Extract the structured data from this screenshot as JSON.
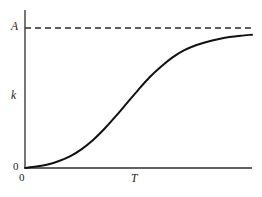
{
  "figure": {
    "background_color": "#ffffff",
    "width": 262,
    "height": 197
  },
  "labels": {
    "asymptote": "A",
    "yaxis": "k",
    "origin_y": "0",
    "origin_x": "0",
    "xaxis": "T"
  },
  "chart_data": {
    "type": "line",
    "title": "",
    "subtitle": "",
    "xlabel": "T",
    "ylabel": "k",
    "grid": false,
    "legend": null,
    "xlim": [
      0,
      1
    ],
    "ylim": [
      0,
      1.0
    ],
    "axis_ticks": {
      "x": [
        "0"
      ],
      "y": [
        "0",
        "A"
      ]
    },
    "annotations": [
      {
        "name": "asymptote-label",
        "text": "A",
        "x": 0,
        "y": 1.0,
        "position": "left-of-axis"
      },
      {
        "name": "yaxis-title",
        "text": "k",
        "x": 0,
        "y": 0.5,
        "position": "left-of-axis"
      },
      {
        "name": "origin-y-zero",
        "text": "0",
        "x": 0,
        "y": 0,
        "position": "left-of-axis"
      },
      {
        "name": "origin-x-zero",
        "text": "0",
        "x": 0,
        "y": 0,
        "position": "below-axis"
      },
      {
        "name": "xaxis-title",
        "text": "T",
        "x": 0.5,
        "y": 0,
        "position": "below-axis"
      }
    ],
    "series": [
      {
        "name": "logistic-growth-curve",
        "style": "solid",
        "color": "#111111",
        "width": 2,
        "x": [
          0.0,
          0.05,
          0.1,
          0.15,
          0.2,
          0.25,
          0.3,
          0.35,
          0.4,
          0.45,
          0.5,
          0.55,
          0.6,
          0.65,
          0.7,
          0.75,
          0.8,
          0.85,
          0.9,
          0.95,
          1.0
        ],
        "values": [
          0.0,
          0.01,
          0.025,
          0.05,
          0.085,
          0.135,
          0.2,
          0.28,
          0.37,
          0.465,
          0.56,
          0.65,
          0.725,
          0.79,
          0.84,
          0.875,
          0.9,
          0.92,
          0.935,
          0.945,
          0.952
        ]
      },
      {
        "name": "asymptote-line",
        "style": "dashed",
        "color": "#2b2b2b",
        "width": 1,
        "x": [
          0.0,
          1.0
        ],
        "values": [
          1.0,
          1.0
        ]
      }
    ]
  },
  "geometry": {
    "axis_color": "#3c3c3c",
    "curve_color": "#111111",
    "dash_color": "#2b2b2b",
    "plot_left": 25,
    "plot_right": 252,
    "plot_top": 10,
    "plot_bottom": 168,
    "asymptote_y": 28,
    "dash_pattern": "6 4"
  }
}
